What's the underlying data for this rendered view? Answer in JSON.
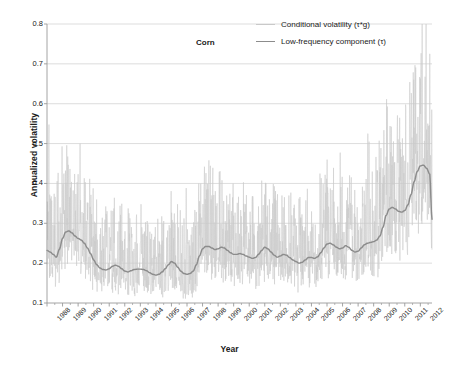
{
  "chart_data": {
    "type": "line",
    "title": "Corn",
    "xlabel": "Year",
    "ylabel": "Annualized volatility",
    "xlim": [
      1988,
      2012.75
    ],
    "ylim": [
      0.1,
      0.8
    ],
    "yticks": [
      "0.8",
      "0.7",
      "0.6",
      "0.5",
      "0.4",
      "0.3",
      "0.2",
      "0.1"
    ],
    "ytick_values": [
      0.8,
      0.7,
      0.6,
      0.5,
      0.4,
      0.3,
      0.2,
      0.1
    ],
    "xticks": [
      "1988",
      "1989",
      "1990",
      "1991",
      "1992",
      "1993",
      "1994",
      "1995",
      "1996",
      "1997",
      "1998",
      "1999",
      "2000",
      "2001",
      "2002",
      "2003",
      "2004",
      "2005",
      "2006",
      "2007",
      "2008",
      "2009",
      "2010",
      "2011",
      "2012"
    ],
    "grid": "horizontal",
    "legend_position": "top-right",
    "colors": {
      "conditional_volatility": "#c9c9c9",
      "low_frequency": "#8c8c8c",
      "gridline": "#d4d4d4",
      "axis": "#9a9a9a",
      "text": "#1a1a1a"
    },
    "series": [
      {
        "name": "Conditional volatility (τ*g)",
        "color": "#c9c9c9",
        "style": "noisy-thin",
        "note": "high-frequency daily series oscillating about tau; spikes to 0.71 (1988), 0.63 (2008), 0.65 (2011)"
      },
      {
        "name": "Low-frequency component (τ)",
        "color": "#8c8c8c",
        "style": "smooth",
        "x": [
          1988.0,
          1988.2,
          1988.4,
          1988.6,
          1988.8,
          1989.0,
          1989.2,
          1989.4,
          1989.6,
          1989.8,
          1990.0,
          1990.2,
          1990.4,
          1990.6,
          1990.8,
          1991.0,
          1991.2,
          1991.4,
          1991.6,
          1991.8,
          1992.0,
          1992.2,
          1992.4,
          1992.6,
          1992.8,
          1993.0,
          1993.2,
          1993.4,
          1993.6,
          1993.8,
          1994.0,
          1994.2,
          1994.4,
          1994.6,
          1994.8,
          1995.0,
          1995.2,
          1995.4,
          1995.6,
          1995.8,
          1996.0,
          1996.2,
          1996.4,
          1996.6,
          1996.8,
          1997.0,
          1997.2,
          1997.4,
          1997.6,
          1997.8,
          1998.0,
          1998.2,
          1998.4,
          1998.6,
          1998.8,
          1999.0,
          1999.2,
          1999.4,
          1999.6,
          1999.8,
          2000.0,
          2000.2,
          2000.4,
          2000.6,
          2000.8,
          2001.0,
          2001.2,
          2001.4,
          2001.6,
          2001.8,
          2002.0,
          2002.2,
          2002.4,
          2002.6,
          2002.8,
          2003.0,
          2003.2,
          2003.4,
          2003.6,
          2003.8,
          2004.0,
          2004.2,
          2004.4,
          2004.6,
          2004.8,
          2005.0,
          2005.2,
          2005.4,
          2005.6,
          2005.8,
          2006.0,
          2006.2,
          2006.4,
          2006.6,
          2006.8,
          2007.0,
          2007.2,
          2007.4,
          2007.6,
          2007.8,
          2008.0,
          2008.2,
          2008.4,
          2008.6,
          2008.8,
          2009.0,
          2009.2,
          2009.4,
          2009.6,
          2009.8,
          2010.0,
          2010.2,
          2010.4,
          2010.6,
          2010.8,
          2011.0,
          2011.2,
          2011.4,
          2011.6,
          2011.8,
          2012.0,
          2012.2,
          2012.4,
          2012.6
        ],
        "y": [
          0.232,
          0.228,
          0.222,
          0.215,
          0.235,
          0.262,
          0.278,
          0.281,
          0.276,
          0.268,
          0.262,
          0.258,
          0.25,
          0.238,
          0.224,
          0.208,
          0.196,
          0.188,
          0.184,
          0.183,
          0.186,
          0.192,
          0.195,
          0.192,
          0.186,
          0.18,
          0.178,
          0.181,
          0.184,
          0.185,
          0.185,
          0.184,
          0.181,
          0.176,
          0.172,
          0.17,
          0.172,
          0.178,
          0.186,
          0.196,
          0.204,
          0.2,
          0.19,
          0.18,
          0.174,
          0.172,
          0.174,
          0.18,
          0.196,
          0.218,
          0.236,
          0.242,
          0.242,
          0.238,
          0.234,
          0.236,
          0.24,
          0.238,
          0.232,
          0.226,
          0.222,
          0.222,
          0.224,
          0.222,
          0.218,
          0.215,
          0.212,
          0.214,
          0.222,
          0.232,
          0.24,
          0.236,
          0.228,
          0.22,
          0.215,
          0.218,
          0.222,
          0.22,
          0.214,
          0.208,
          0.204,
          0.2,
          0.202,
          0.208,
          0.214,
          0.214,
          0.212,
          0.216,
          0.226,
          0.238,
          0.248,
          0.25,
          0.246,
          0.24,
          0.236,
          0.238,
          0.244,
          0.24,
          0.232,
          0.228,
          0.23,
          0.238,
          0.246,
          0.25,
          0.252,
          0.254,
          0.258,
          0.268,
          0.29,
          0.32,
          0.336,
          0.34,
          0.336,
          0.33,
          0.328,
          0.332,
          0.346,
          0.372,
          0.404,
          0.43,
          0.444,
          0.446,
          0.438,
          0.424
        ],
        "y_tail": [
          0.412,
          0.4,
          0.388,
          0.376,
          0.362,
          0.348,
          0.338,
          0.332,
          0.33,
          0.334,
          0.344,
          0.356,
          0.366,
          0.37,
          0.366,
          0.356,
          0.346,
          0.34,
          0.336,
          0.338,
          0.34,
          0.334,
          0.326,
          0.316,
          0.31
        ],
        "x_tail": [
          2009.0,
          2009.2,
          2009.4,
          2009.6,
          2009.8,
          2010.0,
          2010.2,
          2010.4,
          2010.6,
          2010.8,
          2011.0,
          2011.1,
          2011.2,
          2011.3,
          2011.4,
          2011.5,
          2011.6,
          2011.7,
          2011.8,
          2011.9,
          2012.0,
          2012.2,
          2012.4,
          2012.6,
          2012.75
        ]
      }
    ]
  },
  "legend": {
    "items": [
      {
        "label": "Conditional volatility (τ*g)",
        "color": "#c9c9c9"
      },
      {
        "label": "Low-frequency component (τ)",
        "color": "#8c8c8c"
      }
    ]
  }
}
